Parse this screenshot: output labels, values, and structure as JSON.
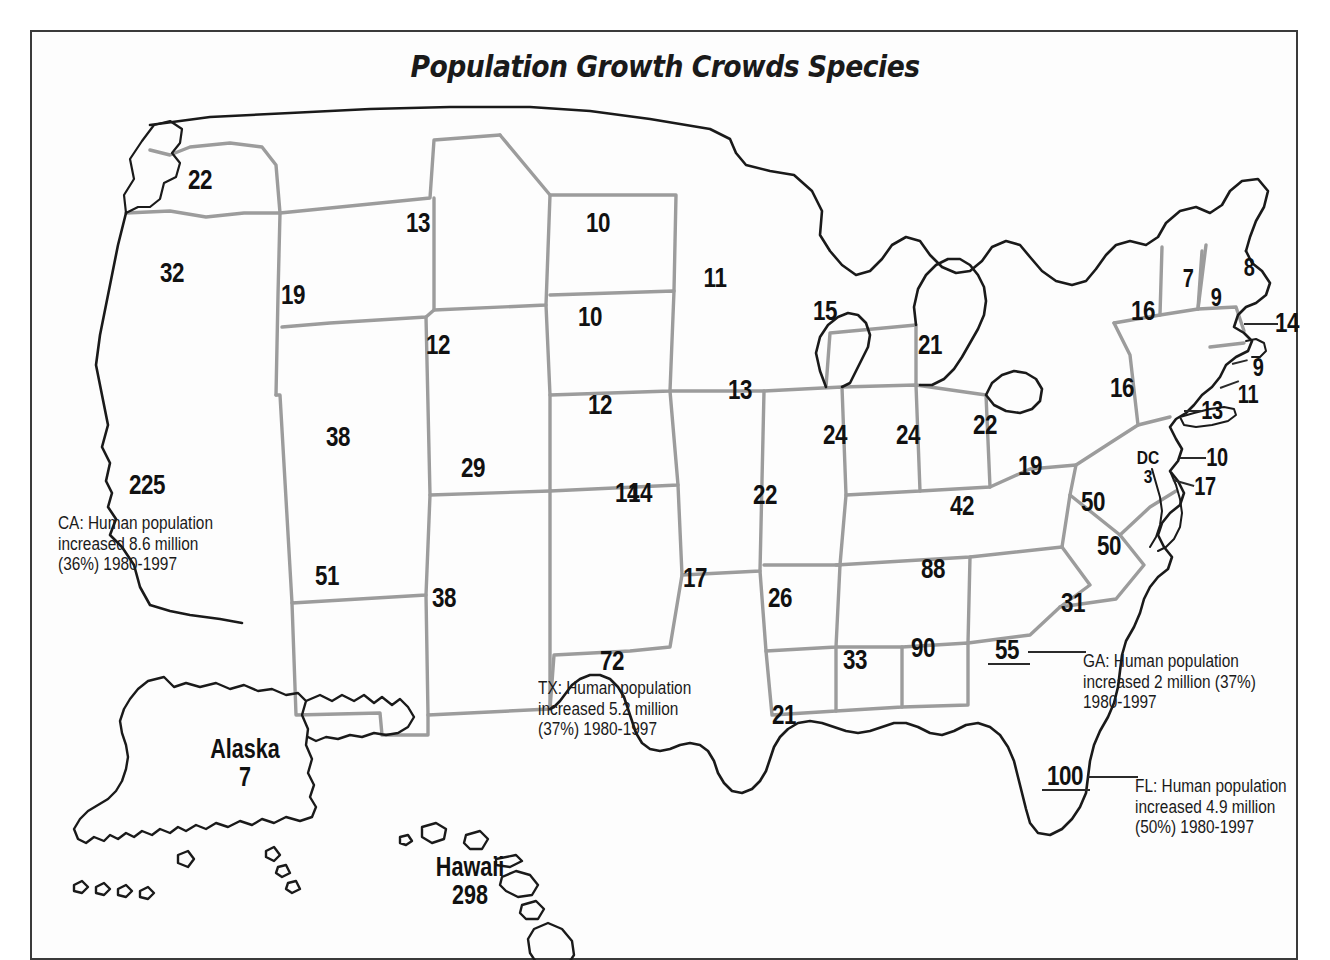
{
  "title": "Population Growth Crowds Species",
  "map": {
    "type": "choropleth-labels",
    "region": "United States",
    "unit": "number of imperiled species",
    "states": [
      {
        "code": "WA",
        "value": "22",
        "x": 170,
        "y": 85,
        "size": "n-lg"
      },
      {
        "code": "OR",
        "value": "32",
        "x": 142,
        "y": 178,
        "size": "n-lg"
      },
      {
        "code": "ID",
        "value": "19",
        "x": 263,
        "y": 200,
        "size": "n-lg"
      },
      {
        "code": "MT",
        "value": "13",
        "x": 388,
        "y": 128,
        "size": "n-lg"
      },
      {
        "code": "ND",
        "value": "10",
        "x": 568,
        "y": 128,
        "size": "n-lg"
      },
      {
        "code": "SD",
        "value": "10",
        "x": 560,
        "y": 222,
        "size": "n-lg"
      },
      {
        "code": "MN",
        "value": "11",
        "x": 685,
        "y": 183,
        "size": "n-lg"
      },
      {
        "code": "WY",
        "value": "12",
        "x": 408,
        "y": 250,
        "size": "n-lg"
      },
      {
        "code": "NE",
        "value": "12",
        "x": 570,
        "y": 310,
        "size": "n-lg"
      },
      {
        "code": "IA",
        "value": "13",
        "x": 710,
        "y": 295,
        "size": "n-lg"
      },
      {
        "code": "WI",
        "value": "15",
        "x": 795,
        "y": 216,
        "size": "n-lg"
      },
      {
        "code": "MI",
        "value": "21",
        "x": 900,
        "y": 250,
        "size": "n-lg"
      },
      {
        "code": "NV",
        "value": "38",
        "x": 308,
        "y": 342,
        "size": "n-lg"
      },
      {
        "code": "UT",
        "value": "29",
        "x": 443,
        "y": 373,
        "size": "n-lg"
      },
      {
        "code": "CO",
        "value": "14",
        "x": 597,
        "y": 398,
        "size": "n-lg"
      },
      {
        "code": "MO",
        "value": "22",
        "x": 735,
        "y": 400,
        "size": "n-lg"
      },
      {
        "code": "IL",
        "value": "24",
        "x": 805,
        "y": 340,
        "size": "n-lg"
      },
      {
        "code": "IN",
        "value": "24",
        "x": 878,
        "y": 340,
        "size": "n-lg"
      },
      {
        "code": "OH",
        "value": "22",
        "x": 955,
        "y": 330,
        "size": "n-lg"
      },
      {
        "code": "PA",
        "value": "16",
        "x": 1092,
        "y": 293,
        "size": "n-lg"
      },
      {
        "code": "NY",
        "value": "16",
        "x": 1113,
        "y": 216,
        "size": "n-lg"
      },
      {
        "code": "VT",
        "value": "7",
        "x": 1158,
        "y": 183,
        "size": "n-md"
      },
      {
        "code": "NH",
        "value": "9",
        "x": 1186,
        "y": 202,
        "size": "n-md"
      },
      {
        "code": "ME",
        "value": "8",
        "x": 1219,
        "y": 172,
        "size": "n-md"
      },
      {
        "code": "MA",
        "value": "14",
        "x": 1257,
        "y": 228,
        "size": "n-lg"
      },
      {
        "code": "RI",
        "value": "9",
        "x": 1228,
        "y": 272,
        "size": "n-md"
      },
      {
        "code": "CT",
        "value": "11",
        "x": 1218,
        "y": 299,
        "size": "n-md"
      },
      {
        "code": "NJ",
        "value": "13",
        "x": 1182,
        "y": 315,
        "size": "n-md"
      },
      {
        "code": "DE",
        "value": "10",
        "x": 1187,
        "y": 362,
        "size": "n-md"
      },
      {
        "code": "MD",
        "value": "17",
        "x": 1175,
        "y": 391,
        "size": "n-md"
      },
      {
        "code": "WV",
        "value": "19",
        "x": 1000,
        "y": 371,
        "size": "n-lg"
      },
      {
        "code": "VA",
        "value": "50",
        "x": 1063,
        "y": 407,
        "size": "n-lg"
      },
      {
        "code": "KY",
        "value": "42",
        "x": 932,
        "y": 411,
        "size": "n-lg"
      },
      {
        "code": "TN",
        "value": "88",
        "x": 903,
        "y": 474,
        "size": "n-lg"
      },
      {
        "code": "NC",
        "value": "50",
        "x": 1079,
        "y": 451,
        "size": "n-lg"
      },
      {
        "code": "SC",
        "value": "31",
        "x": 1043,
        "y": 508,
        "size": "n-lg"
      },
      {
        "code": "GA",
        "value": "55",
        "x": 977,
        "y": 555,
        "size": "n-lg"
      },
      {
        "code": "AL",
        "value": "90",
        "x": 893,
        "y": 553,
        "size": "n-lg"
      },
      {
        "code": "MS",
        "value": "33",
        "x": 825,
        "y": 565,
        "size": "n-lg"
      },
      {
        "code": "AR",
        "value": "26",
        "x": 750,
        "y": 503,
        "size": "n-lg"
      },
      {
        "code": "LA",
        "value": "21",
        "x": 754,
        "y": 620,
        "size": "n-lg"
      },
      {
        "code": "KS",
        "value": "14",
        "x": 610,
        "y": 398,
        "size": "n-lg"
      },
      {
        "code": "OK",
        "value": "17",
        "x": 665,
        "y": 483,
        "size": "n-lg"
      },
      {
        "code": "AZ",
        "value": "51",
        "x": 297,
        "y": 481,
        "size": "n-lg"
      },
      {
        "code": "NM",
        "value": "38",
        "x": 414,
        "y": 503,
        "size": "n-lg"
      },
      {
        "code": "CA",
        "value": "225",
        "x": 117,
        "y": 390,
        "size": "n-lg"
      },
      {
        "code": "TX",
        "value": "72",
        "x": 582,
        "y": 566,
        "size": "n-lg"
      },
      {
        "code": "FL",
        "value": "100",
        "x": 1035,
        "y": 681,
        "size": "n-lg"
      }
    ],
    "dc": {
      "label": "DC",
      "value": "3",
      "x": 1118,
      "y": 372
    },
    "insets": [
      {
        "name": "Alaska",
        "value": "7",
        "x": 215,
        "y": 668
      },
      {
        "name": "Hawaii",
        "value": "298",
        "x": 440,
        "y": 786
      }
    ],
    "annotations": [
      {
        "id": "ca-annotation",
        "lines": [
          "CA: Human population",
          "increased 8.6 million",
          "(36%) 1980-1997"
        ],
        "x": 28,
        "y": 418
      },
      {
        "id": "tx-annotation",
        "lines": [
          "TX: Human population",
          "increased 5.2 million",
          "(37%) 1980-1997"
        ],
        "x": 508,
        "y": 583
      },
      {
        "id": "ga-annotation",
        "lines": [
          "GA: Human population",
          "increased 2 million (37%)",
          "1980-1997"
        ],
        "x": 1053,
        "y": 556
      },
      {
        "id": "fl-annotation",
        "lines": [
          "FL: Human population",
          "increased 4.9 million",
          "(50%) 1980-1997"
        ],
        "x": 1105,
        "y": 681
      }
    ],
    "colors": {
      "state_border": "#9c9c9c",
      "coast_outline": "#1a1a1a",
      "label_text": "#111111",
      "frame": "#3a3a3a",
      "background": "#ffffff"
    }
  }
}
